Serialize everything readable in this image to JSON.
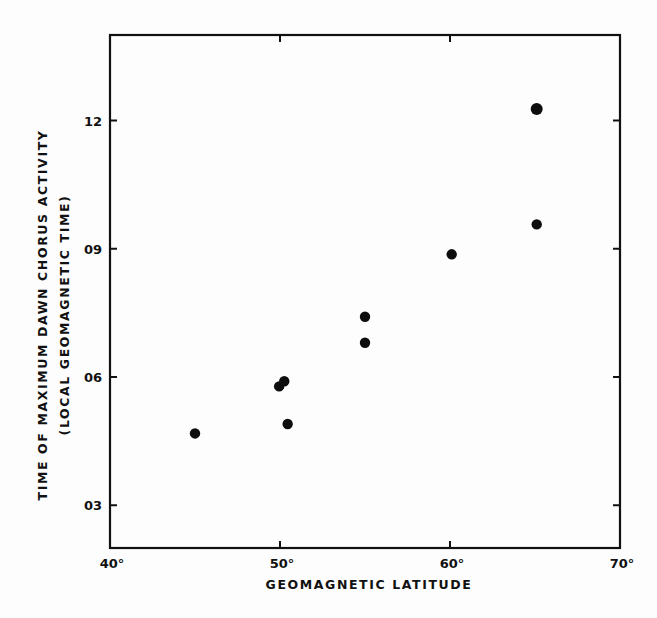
{
  "chart_data": {
    "type": "scatter",
    "title": "",
    "xlabel": "GEOMAGNETIC LATITUDE",
    "ylabel_lines": [
      "TIME OF MAXIMUM DAWN CHORUS ACTIVITY",
      "(LOCAL GEOMAGNETIC TIME)"
    ],
    "ylabel": "TIME OF MAXIMUM DAWN CHORUS ACTIVITY (LOCAL GEOMAGNETIC TIME)",
    "xlim": [
      40,
      70
    ],
    "ylim": [
      2,
      14
    ],
    "x_ticks": [
      40,
      50,
      60,
      70
    ],
    "x_tick_labels": [
      "40°",
      "50°",
      "60°",
      "70°"
    ],
    "y_ticks": [
      3,
      6,
      9,
      12
    ],
    "y_tick_labels": [
      "03",
      "06",
      "09",
      "12"
    ],
    "grid": false,
    "legend": null,
    "series": [
      {
        "name": "observations",
        "marker": "filled-circle",
        "color": "#0d0d0d",
        "points": [
          {
            "x": 45.0,
            "y": 4.68
          },
          {
            "x": 49.95,
            "y": 5.78
          },
          {
            "x": 50.25,
            "y": 5.9
          },
          {
            "x": 50.45,
            "y": 4.9
          },
          {
            "x": 55.0,
            "y": 6.8
          },
          {
            "x": 55.0,
            "y": 7.41
          },
          {
            "x": 60.1,
            "y": 8.87
          },
          {
            "x": 65.1,
            "y": 9.57
          },
          {
            "x": 65.1,
            "y": 12.27
          }
        ]
      }
    ]
  },
  "layout": {
    "plot_left": 110,
    "plot_right": 620,
    "plot_top": 35,
    "plot_bottom": 548,
    "tick_length": 7,
    "point_radius": 5.2
  }
}
